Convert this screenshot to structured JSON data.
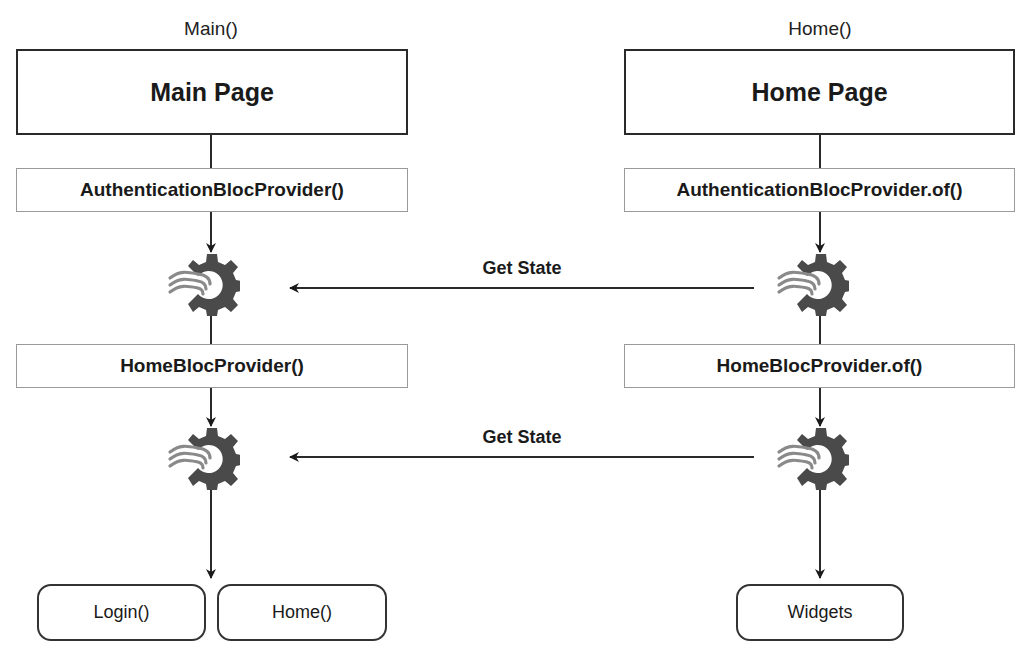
{
  "left_column": {
    "caption": "Main()",
    "page_title": "Main Page",
    "auth_provider": "AuthenticationBlocProvider()",
    "home_provider": "HomeBlocProvider()",
    "auth_bloc_icon": "bloc-gear-icon",
    "home_bloc_icon": "bloc-gear-icon",
    "outputs": [
      "Login()",
      "Home()"
    ]
  },
  "right_column": {
    "caption": "Home()",
    "page_title": "Home Page",
    "auth_provider": "AuthenticationBlocProvider.of()",
    "home_provider": "HomeBlocProvider.of()",
    "auth_bloc_icon": "bloc-gear-icon",
    "home_bloc_icon": "bloc-gear-icon",
    "outputs": [
      "Widgets"
    ]
  },
  "connections": [
    {
      "label": "Get State",
      "from": "right auth bloc",
      "to": "left auth bloc"
    },
    {
      "label": "Get State",
      "from": "right home bloc",
      "to": "left home bloc"
    }
  ],
  "colors": {
    "stroke": "#2a2a2a",
    "provider_border": "#9a9a9a",
    "gear": "#4a4a4a",
    "waves": "#8a8a8a"
  }
}
